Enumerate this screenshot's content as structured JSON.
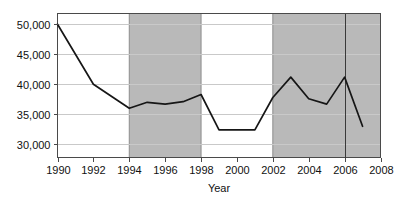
{
  "chart_data": {
    "type": "line",
    "title": "",
    "subtitle": "",
    "xlabel": "Year",
    "ylabel": "",
    "xlim": [
      1990,
      2008
    ],
    "ylim": [
      27800,
      51800
    ],
    "grid": true,
    "legend": null,
    "x": [
      1990,
      1991,
      1992,
      1993,
      1994,
      1995,
      1996,
      1997,
      1998,
      1999,
      2000,
      2001,
      2002,
      2003,
      2004,
      2005,
      2006,
      2007
    ],
    "series": [
      {
        "name": "value",
        "color": "#161616",
        "values": [
          50000,
          45000,
          40000,
          38000,
          36000,
          37000,
          36700,
          37100,
          38300,
          32400,
          32400,
          32400,
          37800,
          41200,
          37600,
          36700,
          41200,
          33000
        ]
      }
    ],
    "ytick_values": [
      30000,
      35000,
      40000,
      45000,
      50000
    ],
    "ytick_labels": [
      "30,000",
      "35,000",
      "40,000",
      "45,000",
      "50,000"
    ],
    "xtick_values": [
      1990,
      1992,
      1994,
      1996,
      1998,
      2000,
      2002,
      2004,
      2006,
      2008
    ],
    "xtick_labels": [
      "1990",
      "1992",
      "1994",
      "1996",
      "1998",
      "2000",
      "2002",
      "2004",
      "2006",
      "2008"
    ],
    "shaded_bands": [
      {
        "name": "band-1994-1998",
        "start": 1994,
        "end": 1998,
        "color": "#b9b9b9"
      },
      {
        "name": "band-2002-2008",
        "start": 2002,
        "end": 2008,
        "color": "#b9b9b9"
      }
    ],
    "vertical_markers": [
      {
        "name": "marker-2006",
        "x": 2006,
        "color": "#3a3a3a"
      }
    ],
    "colors": {
      "line": "#161616",
      "band": "#b9b9b9",
      "band_border": "#8d8d8d",
      "grid": "#c9c9c9",
      "axis": "#4a4a4a",
      "background": "#ffffff",
      "text": "#111111"
    }
  }
}
